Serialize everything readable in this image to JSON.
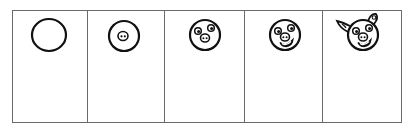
{
  "colors": {
    "frame": "#6a6a6a",
    "ink": "#111111",
    "background": "#ffffff"
  },
  "steps": [
    {
      "label": "Step 1",
      "description": "Draw a circle for the head"
    },
    {
      "label": "Step 2",
      "description": "Add an oval snout with two nostrils"
    },
    {
      "label": "Step 3",
      "description": "Add two eyes above the snout"
    },
    {
      "label": "Step 4",
      "description": "Add a smiling mouth"
    },
    {
      "label": "Step 5",
      "description": "Add two ears on top"
    }
  ]
}
